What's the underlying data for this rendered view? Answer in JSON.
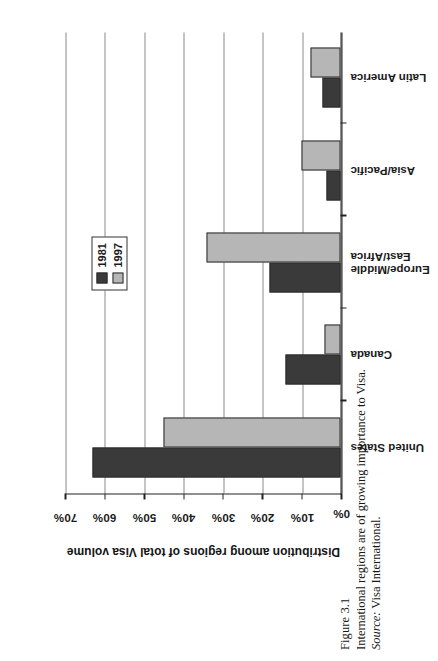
{
  "figure": {
    "number": "Figure 3.1",
    "caption": "International regions are of growing importance to Visa.",
    "source_prefix": "Source:",
    "source_value": " Visa International."
  },
  "chart_data": {
    "type": "bar",
    "orientation": "vertical",
    "title": "",
    "xlabel": "",
    "ylabel": "Distribution among regions of total Visa volume",
    "ylim": [
      0,
      70
    ],
    "ytick_labels": [
      "0%",
      "10%",
      "20%",
      "30%",
      "40%",
      "50%",
      "60%",
      "70%"
    ],
    "ytick_values": [
      0,
      10,
      20,
      30,
      40,
      50,
      60,
      70
    ],
    "grid": true,
    "legend_position": "upper-center-right",
    "categories": [
      "United States",
      "Canada",
      "Europe/Middle\nEast/Africa",
      "Asia/Pacific",
      "Latin America"
    ],
    "category_lines": [
      [
        "United States"
      ],
      [
        "Canada"
      ],
      [
        "Europe/Middle",
        "East/Africa"
      ],
      [
        "Asia/Pacific"
      ],
      [
        "Latin America"
      ]
    ],
    "series": [
      {
        "name": "1981",
        "color": "#3a3a3a",
        "values": [
          63,
          14,
          18,
          3.5,
          4.5
        ]
      },
      {
        "name": "1997",
        "color": "#b6b6b6",
        "values": [
          45,
          4,
          34,
          10,
          7.5
        ]
      }
    ]
  },
  "colors": {
    "series_1981": "#3a3a3a",
    "series_1997": "#b6b6b6",
    "axis": "#222222",
    "gridline": "#8a8a8a",
    "page": "#ffffff"
  }
}
